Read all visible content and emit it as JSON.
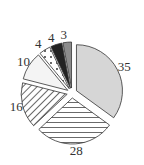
{
  "chart_data": {
    "type": "pie",
    "title": "",
    "exploded": true,
    "start_angle": "12 o'clock",
    "direction": "clockwise",
    "categories": [
      "A",
      "B",
      "C",
      "D",
      "E",
      "F",
      "G"
    ],
    "values": [
      35,
      28,
      16,
      10,
      4,
      4,
      3
    ],
    "labels": [
      "35",
      "28",
      "16",
      "10",
      "4",
      "4",
      "3"
    ],
    "fills": [
      "light-gray",
      "horizontal-hatch",
      "diagonal-hatch",
      "near-white",
      "dotted",
      "black",
      "medium-gray"
    ],
    "colors": [
      "#d6d6d6",
      "#ffffff",
      "#ffffff",
      "#f2f2f2",
      "#ffffff",
      "#222222",
      "#8c8c8c"
    ],
    "legend": null
  }
}
